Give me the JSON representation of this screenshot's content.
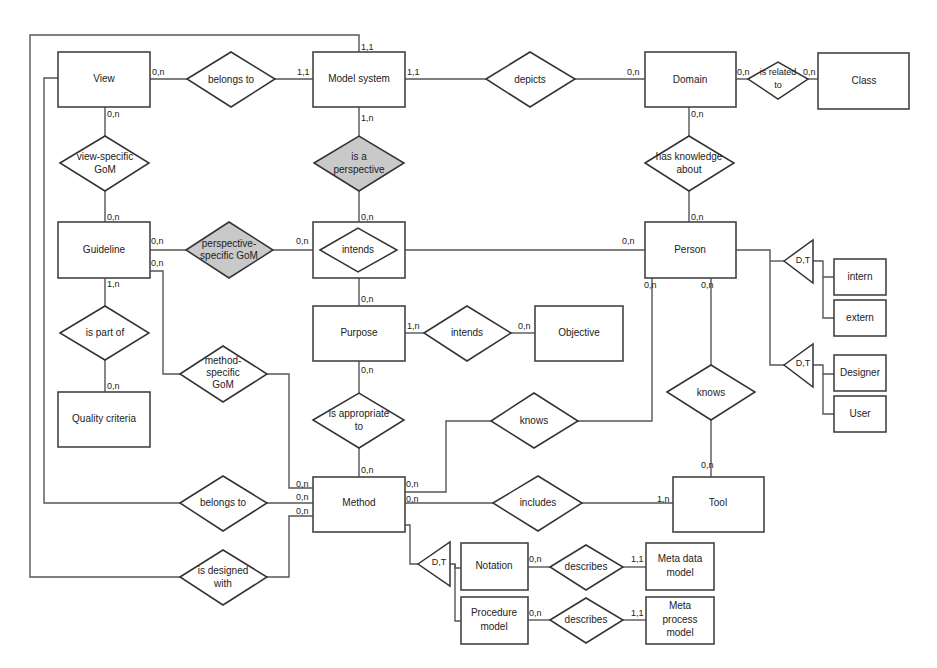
{
  "entities": {
    "view": "View",
    "model_system": "Model system",
    "domain": "Domain",
    "class": "Class",
    "guideline": "Guideline",
    "person": "Person",
    "purpose": "Purpose",
    "objective": "Objective",
    "quality_criteria": "Quality criteria",
    "method": "Method",
    "tool": "Tool",
    "notation": "Notation",
    "procedure_model_1": "Procedure",
    "procedure_model_2": "model",
    "meta_data_model_1": "Meta data",
    "meta_data_model_2": "model",
    "meta_process_model_1": "Meta",
    "meta_process_model_2": "process",
    "meta_process_model_3": "model",
    "intern": "intern",
    "extern": "extern",
    "designer": "Designer",
    "user": "User"
  },
  "relationships": {
    "view_belongs_to": "belongs to",
    "depicts": "depicts",
    "is_related_to_1": "is related",
    "is_related_to_2": "to",
    "view_specific_gom_1": "view-specific",
    "view_specific_gom_2": "GoM",
    "is_a_perspective_1": "is a",
    "is_a_perspective_2": "perspective",
    "has_knowledge_about_1": "has knowledge",
    "has_knowledge_about_2": "about",
    "perspective_specific_gom_1": "perspective-",
    "perspective_specific_gom_2": "specific GoM",
    "intends_person": "intends",
    "is_part_of": "is part of",
    "intends_objective": "intends",
    "method_specific_gom_1": "method-",
    "method_specific_gom_2": "specific",
    "method_specific_gom_3": "GoM",
    "knows_person_tool": "knows",
    "is_appropriate_to_1": "is appropriate",
    "is_appropriate_to_2": "to",
    "knows_method": "knows",
    "method_belongs_to": "belongs to",
    "includes": "includes",
    "is_designed_with_1": "is designed",
    "is_designed_with_2": "with",
    "describes_notation": "describes",
    "describes_procedure": "describes"
  },
  "generalizations": {
    "person_internal": "D,T",
    "person_role": "D,T",
    "method_parts": "D,T"
  },
  "cardinalities": {
    "view_belongs_view": "0,n",
    "view_belongs_model": "1,1",
    "model_top": "1,1",
    "model_depicts": "1,1",
    "domain_depicts": "0,n",
    "domain_related": "0,n",
    "class_related": "0,n",
    "view_gom": "0,n",
    "model_perspective": "1,n",
    "domain_knowledge": "0,n",
    "guideline_view_gom": "0,n",
    "intends_perspective": "0,n",
    "person_knowledge": "0,n",
    "guideline_persp": "0,n",
    "intends_persp_gom": "0,n",
    "guideline_method": "0,n",
    "person_intends": "0,n",
    "guideline_part": "1,n",
    "purpose_intends": "0,n",
    "person_knows_method": "0,n",
    "person_knows_tool": "0,n",
    "purpose_objective": "1,n",
    "objective_intends": "0,n",
    "quality_part": "0,n",
    "purpose_appropriate": "0,n",
    "method_appropriate": "0,n",
    "tool_knows": "0,n",
    "method_gom": "0,n",
    "method_belongs": "0,n",
    "method_designed": "0,n",
    "method_knows": "0,n",
    "method_includes": "0,n",
    "tool_includes": "1,n",
    "notation_describes": "0,n",
    "metadata_describes": "1,1",
    "procedure_describes": "0,n",
    "metaprocess_describes": "1,1"
  }
}
